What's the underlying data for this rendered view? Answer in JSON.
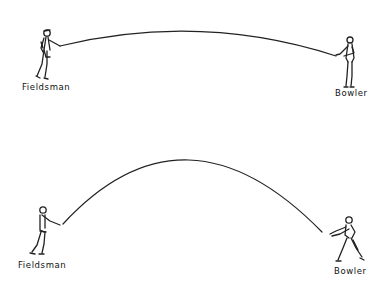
{
  "diagram": {
    "colors": {
      "background": "#ffffff",
      "ink": "#222222"
    },
    "top_scene": {
      "left_figure_label": "Fieldsman",
      "right_figure_label": "Bowler",
      "trajectory": "flat arc"
    },
    "bottom_scene": {
      "left_figure_label": "Fieldsman",
      "right_figure_label": "Bowler",
      "trajectory": "high arc"
    }
  }
}
